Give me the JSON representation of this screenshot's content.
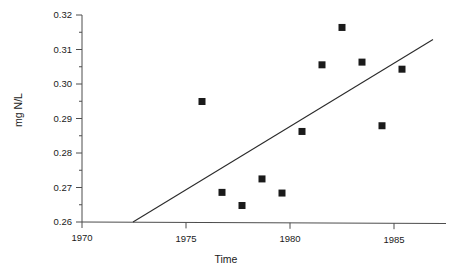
{
  "chart_data": {
    "type": "scatter",
    "title": "",
    "xlabel": "Time",
    "ylabel": "mg N/L",
    "xlim": [
      1969.0,
      1987.2
    ],
    "ylim": [
      0.26,
      0.3215
    ],
    "grid": false,
    "legend": "none",
    "x_ticks": [
      "1970",
      "1975",
      "1980",
      "1985"
    ],
    "x_tick_values": [
      1970,
      1975,
      1980,
      1985
    ],
    "x_minor_ticks": [
      1971,
      1972,
      1973,
      1974,
      1976,
      1977,
      1978,
      1979,
      1981,
      1982,
      1983,
      1984,
      1986
    ],
    "y_ticks": [
      "0.26",
      "0.27",
      "0.28",
      "0.29",
      "0.30",
      "0.31",
      "0.32"
    ],
    "y_tick_values": [
      0.26,
      0.27,
      0.28,
      0.29,
      0.3,
      0.31,
      0.32
    ],
    "y_minor_ticks": [
      0.265,
      0.275,
      0.285,
      0.295,
      0.305,
      0.315
    ],
    "marker": "filled-square",
    "marker_color": "#1a1a1a",
    "line_color": "#2b2b2b",
    "axis_color": "#4d4d4d",
    "background_color": "#ffffff",
    "x": [
      1975,
      1976,
      1977,
      1978,
      1979,
      1980,
      1981,
      1982,
      1983,
      1984,
      1985
    ],
    "y": [
      0.2958,
      0.2688,
      0.2649,
      0.2728,
      0.2686,
      0.2869,
      0.3067,
      0.3178,
      0.3075,
      0.2886,
      0.3054
    ],
    "series": [
      {
        "name": "observations",
        "kind": "scatter",
        "points": [
          {
            "x": 1975,
            "y": 0.2958
          },
          {
            "x": 1976,
            "y": 0.2688
          },
          {
            "x": 1977,
            "y": 0.2649
          },
          {
            "x": 1978,
            "y": 0.2728
          },
          {
            "x": 1979,
            "y": 0.2686
          },
          {
            "x": 1980,
            "y": 0.2869
          },
          {
            "x": 1981,
            "y": 0.3067
          },
          {
            "x": 1982,
            "y": 0.3178
          },
          {
            "x": 1983,
            "y": 0.3075
          },
          {
            "x": 1984,
            "y": 0.2886
          },
          {
            "x": 1985,
            "y": 0.3054
          }
        ]
      },
      {
        "name": "trend-line",
        "kind": "line",
        "points": [
          {
            "x": 1971.55,
            "y": 0.26
          },
          {
            "x": 1986.55,
            "y": 0.3142
          }
        ]
      }
    ]
  }
}
